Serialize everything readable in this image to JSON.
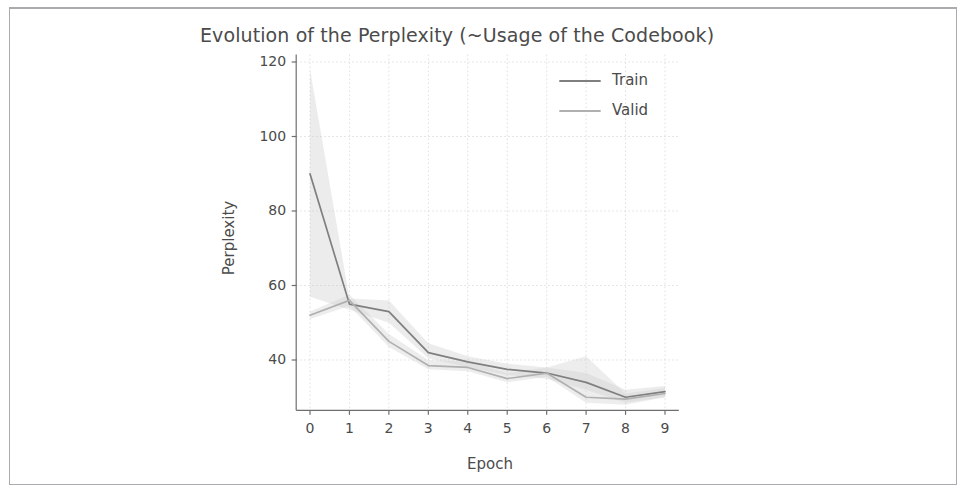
{
  "figure": {
    "frame_color": "#a9abaf",
    "background": "#ffffff"
  },
  "chart_data": {
    "type": "line",
    "title": "Evolution of the Perplexity (~Usage of the Codebook)",
    "xlabel": "Epoch",
    "ylabel": "Perplexity",
    "x": [
      0,
      1,
      2,
      3,
      4,
      5,
      6,
      7,
      8,
      9
    ],
    "xticks": [
      "0",
      "1",
      "2",
      "3",
      "4",
      "5",
      "6",
      "7",
      "8",
      "9"
    ],
    "yticks": [
      "40",
      "60",
      "80",
      "100",
      "120"
    ],
    "ytick_values": [
      40,
      60,
      80,
      100,
      120
    ],
    "xlim": [
      -0.35,
      9.35
    ],
    "ylim": [
      26.5,
      122.0
    ],
    "grid": true,
    "legend_position": "upper right",
    "series": [
      {
        "name": "Train",
        "color": "#7f7f7f",
        "values": [
          90.0,
          55.0,
          53.0,
          42.0,
          39.5,
          37.5,
          36.5,
          34.0,
          30.0,
          31.5
        ],
        "band_lower": [
          57.0,
          53.5,
          50.0,
          40.5,
          38.0,
          36.0,
          35.0,
          32.0,
          28.5,
          30.0
        ],
        "band_upper": [
          118.0,
          56.5,
          56.0,
          44.5,
          41.0,
          39.0,
          38.0,
          36.5,
          32.0,
          33.0
        ],
        "band_color": "#c8c8c8",
        "band_alpha": 0.35
      },
      {
        "name": "Valid",
        "color": "#b0b0b0",
        "values": [
          52.0,
          56.0,
          45.0,
          38.5,
          38.0,
          35.0,
          36.5,
          30.0,
          29.5,
          31.0
        ],
        "band_lower": [
          51.0,
          54.5,
          43.5,
          37.5,
          37.0,
          34.0,
          35.5,
          28.5,
          28.0,
          30.0
        ],
        "band_upper": [
          53.0,
          57.5,
          47.0,
          40.0,
          39.5,
          36.5,
          38.0,
          41.0,
          31.0,
          32.5
        ],
        "band_color": "#d2d2d2",
        "band_alpha": 0.4
      }
    ]
  },
  "legend": {
    "entries": [
      {
        "label": "Train",
        "color": "#7f7f7f"
      },
      {
        "label": "Valid",
        "color": "#b0b0b0"
      }
    ]
  }
}
